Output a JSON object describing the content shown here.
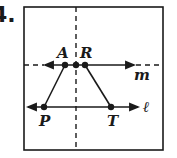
{
  "problem_number": "4.",
  "figure": {
    "frame": {
      "x": 24,
      "y": 7,
      "w": 139,
      "h": 143
    },
    "vertical_axis": {
      "x": 76,
      "style": "dashed"
    },
    "lines": [
      {
        "name": "m",
        "y": 65,
        "style": "solid with dashed extensions",
        "label": "m"
      },
      {
        "name": "ℓ",
        "y": 107,
        "style": "solid",
        "label": "ℓ"
      }
    ],
    "points": [
      {
        "label": "A",
        "x": 65,
        "y": 65
      },
      {
        "label": "",
        "x": 76,
        "y": 65
      },
      {
        "label": "R",
        "x": 85,
        "y": 65
      },
      {
        "label": "P",
        "x": 44,
        "y": 107
      },
      {
        "label": "T",
        "x": 111,
        "y": 107
      }
    ],
    "segments": [
      [
        "A",
        "P"
      ],
      [
        "R",
        "T"
      ]
    ],
    "colors": {
      "ink": "#1a1a1a",
      "background": "#ffffff"
    }
  },
  "labels": {
    "A": "A",
    "R": "R",
    "P": "P",
    "T": "T",
    "m": "m",
    "l": "ℓ"
  }
}
